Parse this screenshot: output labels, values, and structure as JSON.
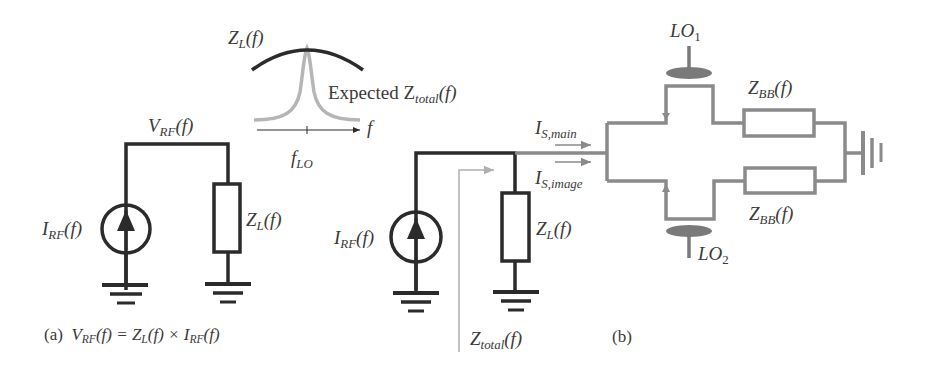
{
  "colors": {
    "dark_wire": "#2b2b2b",
    "gray_wire": "#8a8a8a",
    "light_gray": "#b5b5b5",
    "text": "#3a3a3a",
    "lo_ellipse": "#7a7a7a"
  },
  "inset_plot": {
    "curve_dark_label_main": "Z",
    "curve_dark_label_sub": "L",
    "curve_dark_label_tail": "(f)",
    "curve_light_label_prefix": "Expected Z",
    "curve_light_label_sub": "total",
    "curve_light_label_tail": "(f)",
    "axis_label": "f",
    "tick_label_main": "f",
    "tick_label_sub": "LO"
  },
  "panel_a": {
    "node_label_main": "V",
    "node_label_sub": "RF",
    "node_label_tail": "(f)",
    "source_label_main": "I",
    "source_label_sub": "RF",
    "source_label_tail": "(f)",
    "load_label_main": "Z",
    "load_label_sub": "L",
    "load_label_tail": "(f)",
    "caption_tag": "(a)",
    "caption_eq": {
      "v": "V",
      "v_sub": "RF",
      "v_tail": "(f) = Z",
      "z_sub": "L",
      "z_tail": "(f) × I",
      "i_sub": "RF",
      "i_tail": "(f)"
    }
  },
  "panel_b": {
    "source_label_main": "I",
    "source_label_sub": "RF",
    "source_label_tail": "(f)",
    "load_label_main": "Z",
    "load_label_sub": "L",
    "load_label_tail": "(f)",
    "total_label_main": "Z",
    "total_label_sub": "total",
    "total_label_tail": "(f)",
    "current_main_label": "I",
    "current_main_sub": "S,main",
    "current_image_label": "I",
    "current_image_sub": "S,image",
    "lo1_main": "LO",
    "lo1_sub": "1",
    "lo2_main": "LO",
    "lo2_sub": "2",
    "zbb_top_main": "Z",
    "zbb_top_sub": "BB",
    "zbb_top_tail": "(f)",
    "zbb_bottom_main": "Z",
    "zbb_bottom_sub": "BB",
    "zbb_bottom_tail": "(f)",
    "caption_tag": "(b)"
  }
}
